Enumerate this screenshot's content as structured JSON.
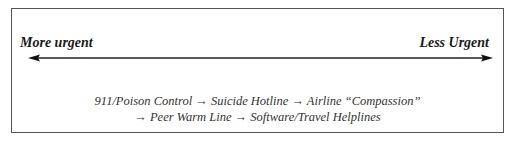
{
  "diagram": {
    "left_label": "More urgent",
    "right_label": "Less Urgent",
    "arrow": "bidirectional",
    "line1": "911/Poison Control → Suicide Hotline → Airline “Compassion”",
    "line2": "→ Peer Warm Line → Software/Travel Helplines",
    "sequence": [
      "911/Poison Control",
      "Suicide Hotline",
      "Airline “Compassion”",
      "Peer Warm Line",
      "Software/Travel Helplines"
    ]
  }
}
